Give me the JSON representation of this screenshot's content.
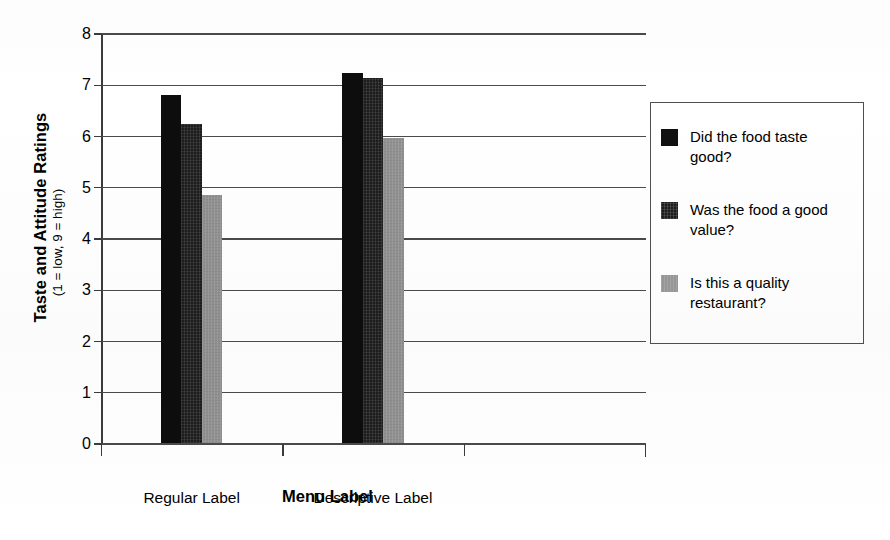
{
  "chart_data": {
    "type": "bar",
    "title": "",
    "xlabel": "Menu Label",
    "ylabel": "Taste and Attitude Ratings",
    "ylabel_sub": "(1 = low, 9 = high)",
    "categories": [
      "Regular Label",
      "Descriptive Label"
    ],
    "yticks": [
      "8",
      "7",
      "6",
      "5",
      "4",
      "3",
      "2",
      "1",
      "0"
    ],
    "ylim": [
      0,
      8
    ],
    "ytick_step": 1,
    "grid": "horizontal",
    "legend_position": "right",
    "series": [
      {
        "name": "Did the food taste good?",
        "color": "#0d0d0d",
        "values": [
          6.8,
          7.22
        ]
      },
      {
        "name": "Was the food a good value?",
        "color": "#1d1d1d",
        "values": [
          6.22,
          7.12
        ]
      },
      {
        "name": "Is this a quality restaurant?",
        "color": "#919191",
        "values": [
          4.83,
          5.95
        ]
      }
    ]
  },
  "legend": {
    "items": [
      {
        "label": "Did the food taste good?",
        "swatch": "legend-swatch-series-1"
      },
      {
        "label": "Was the food a good value?",
        "swatch": "legend-swatch-series-2"
      },
      {
        "label": "Is this a quality restaurant?",
        "swatch": "legend-swatch-series-3"
      }
    ]
  },
  "axes": {
    "y_title": "Taste and Attitude Ratings",
    "y_subtitle": "(1 = low, 9 = high)",
    "x_title": "Menu Label",
    "y_tick_labels": [
      "8",
      "7",
      "6",
      "5",
      "4",
      "3",
      "2",
      "1",
      "0"
    ],
    "x_tick_labels": [
      "Regular Label",
      "Descriptive Label"
    ]
  }
}
